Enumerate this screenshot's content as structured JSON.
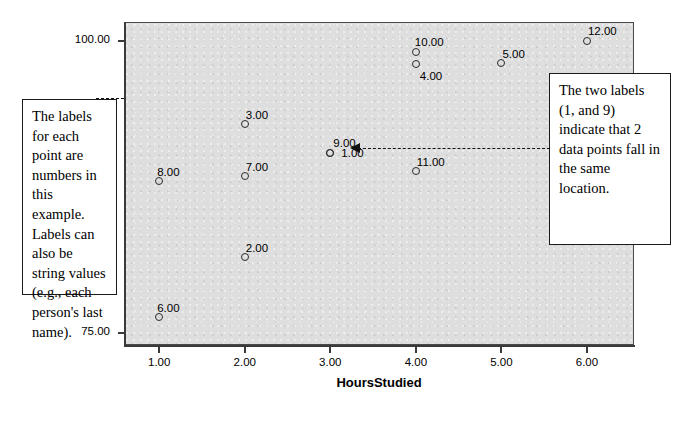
{
  "chart_data": {
    "type": "scatter",
    "title": "",
    "xlabel": "HoursStudied",
    "ylabel": "",
    "xlim": [
      0.6,
      6.55
    ],
    "ylim": [
      74.0,
      101.6
    ],
    "grid": false,
    "legend": "none",
    "x_ticks": [
      "1.00",
      "2.00",
      "3.00",
      "4.00",
      "5.00",
      "6.00"
    ],
    "x_tick_values": [
      1,
      2,
      3,
      4,
      5,
      6
    ],
    "y_ticks": [
      "100.00",
      "75.00"
    ],
    "y_tick_values": [
      100,
      75
    ],
    "point_label_note": "each marker is labelled with its case number",
    "points": [
      {
        "label": "6.00",
        "x": 1,
        "y": 76.4,
        "label_dx": -2,
        "label_dy": -15
      },
      {
        "label": "8.00",
        "x": 1,
        "y": 88.0,
        "label_dx": -2,
        "label_dy": -15
      },
      {
        "label": "2.00",
        "x": 2,
        "y": 81.5,
        "label_dx": 1,
        "label_dy": -15
      },
      {
        "label": "7.00",
        "x": 2,
        "y": 88.4,
        "label_dx": 1,
        "label_dy": -15
      },
      {
        "label": "3.00",
        "x": 2,
        "y": 92.9,
        "label_dx": 1,
        "label_dy": -15
      },
      {
        "label": "9.00",
        "x": 3,
        "y": 90.4,
        "label_dx": 3,
        "label_dy": -16
      },
      {
        "label": "1.00",
        "x": 3,
        "y": 90.4,
        "label_dx": 11,
        "label_dy": -6
      },
      {
        "label": "11.00",
        "x": 4,
        "y": 88.9,
        "label_dx": 1,
        "label_dy": -15
      },
      {
        "label": "4.00",
        "x": 4,
        "y": 98.0,
        "label_dx": 4,
        "label_dy": 6
      },
      {
        "label": "10.00",
        "x": 4,
        "y": 99.0,
        "label_dx": -1,
        "label_dy": -16
      },
      {
        "label": "5.00",
        "x": 5,
        "y": 98.1,
        "label_dx": 1,
        "label_dy": -15
      },
      {
        "label": "12.00",
        "x": 6,
        "y": 100.0,
        "label_dx": 1,
        "label_dy": -16
      }
    ],
    "annotations": [
      {
        "name": "labels-explanation",
        "text": "The labels for each point are numbers in this example. Labels can also be string values (e.g., each person's last name)."
      },
      {
        "name": "overlap-explanation",
        "text": "The two labels (1, and 9) indicate that 2 data points fall in the same location.",
        "points_to": "the overlapping markers labelled 9.00 and 1.00 at HoursStudied = 3.00"
      }
    ],
    "colors": {
      "plot_background": "#dedede",
      "page_background": "#ffffff",
      "axis": "#3a3a3a",
      "marker_outline": "#2b2b2b",
      "callout_border": "#1b1b1b",
      "text": "#000000"
    }
  }
}
